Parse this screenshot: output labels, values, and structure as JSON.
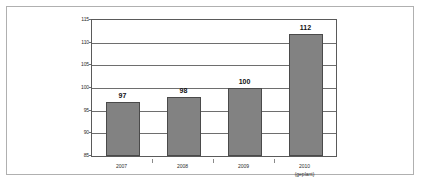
{
  "chart_data": {
    "type": "bar",
    "title": "",
    "subtitle": "",
    "xlabel": "",
    "ylabel": "",
    "categories": [
      "2007",
      "2008",
      "2009",
      "2010"
    ],
    "category_sublabels": [
      "",
      "",
      "",
      "(geplant)"
    ],
    "values": [
      97,
      98,
      100,
      112
    ],
    "data_labels": [
      "97",
      "98",
      "100",
      "112"
    ],
    "ylim": [
      85,
      115
    ],
    "yticks": [
      85,
      90,
      95,
      100,
      105,
      110,
      115
    ],
    "ytick_labels": [
      "85",
      "90",
      "95",
      "100",
      "105",
      "110",
      "115"
    ],
    "grid": true,
    "grid_orientation": "horizontal",
    "legend": false,
    "legend_position": "none",
    "bar_color": "#828282",
    "bar_border_color": "#4a4a4a",
    "gridline_color": "#6e6e6e",
    "axis_color": "#5a5a5a",
    "frame_color": "#b0b0b0",
    "background_color": "#ffffff",
    "label_color": "#111111"
  }
}
